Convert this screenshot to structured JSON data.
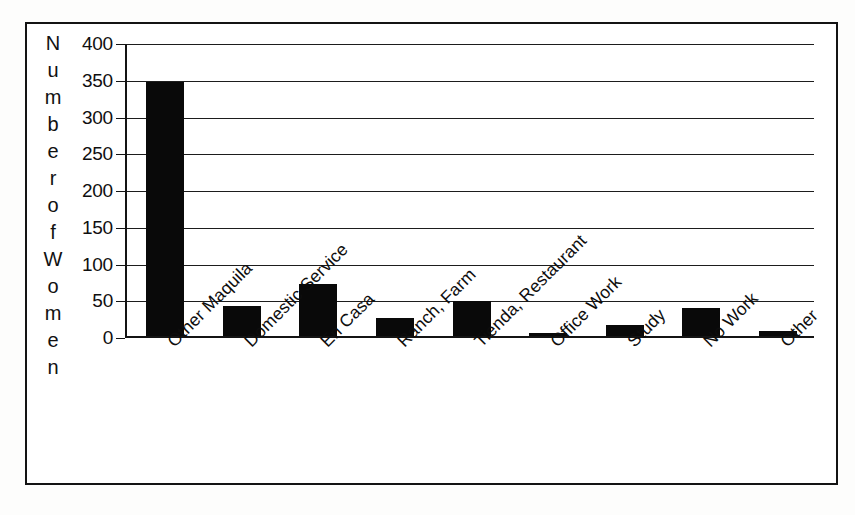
{
  "chart_data": {
    "type": "bar",
    "title": "",
    "xlabel": "",
    "ylabel": "Number of Women",
    "ylabel_chars": [
      "N",
      "u",
      "m",
      "b",
      "e",
      "r",
      "",
      "o",
      "f",
      "",
      "W",
      "o",
      "m",
      "e",
      "n"
    ],
    "categories": [
      "Other Maquila",
      "Domestic Service",
      "En Casa",
      "Ranch, Farm",
      "Tienda, Restaurant",
      "Office Work",
      "Study",
      "No Work",
      "Other"
    ],
    "values": [
      348,
      44,
      73,
      27,
      51,
      7,
      18,
      41,
      10
    ],
    "ylim": [
      0,
      400
    ],
    "yticks": [
      0,
      50,
      100,
      150,
      200,
      250,
      300,
      350,
      400
    ],
    "ytick_labels": [
      "0",
      "50",
      "100",
      "150",
      "200",
      "250",
      "300",
      "350",
      "400"
    ],
    "grid": true,
    "legend": false,
    "bar_color": "#090909",
    "axis_color": "#141414",
    "grid_color": "#1d1d1d",
    "background_color": "#ffffff"
  }
}
